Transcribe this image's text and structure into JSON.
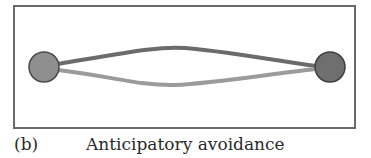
{
  "figure": {
    "panel_label": "(b)",
    "caption": "Anticipatory avoidance"
  },
  "diagram": {
    "nodes": [
      {
        "id": "left-node",
        "cx": 44,
        "cy": 67,
        "r": 15,
        "fill": "#8f8f8f",
        "stroke": "#4a4a4a"
      },
      {
        "id": "right-node",
        "cx": 330,
        "cy": 67,
        "r": 15,
        "fill": "#6f6f6f",
        "stroke": "#3f3f3f"
      }
    ],
    "paths": [
      {
        "id": "upper-path",
        "color": "#6b6b6b",
        "width": 4
      },
      {
        "id": "lower-path",
        "color": "#9b9b9b",
        "width": 4
      }
    ]
  }
}
